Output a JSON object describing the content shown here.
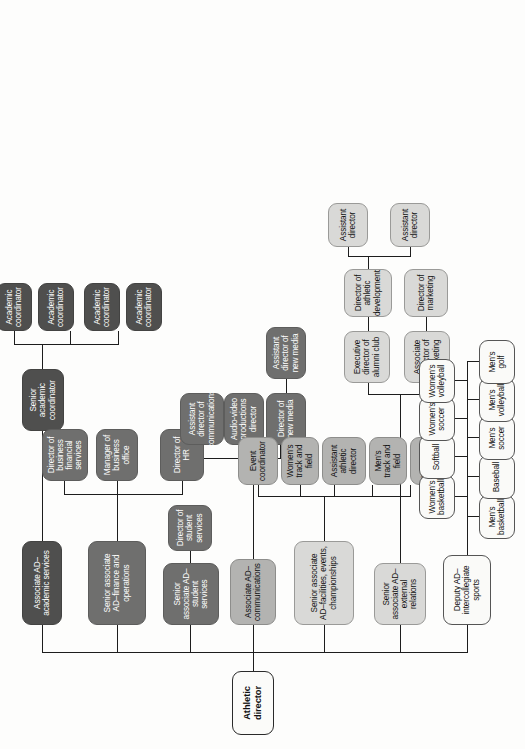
{
  "chart": {
    "type": "org-chart",
    "orientation": "rotated-90",
    "palette": {
      "root": "#fbfbf9",
      "white": "#fafaf8",
      "light": "#d9d9d7",
      "mid": "#b3b3b1",
      "dark": "#6f6f6e",
      "darker": "#4f4f4e",
      "line": "#1d1d1d"
    }
  },
  "root": {
    "label": "Athletic director"
  },
  "branches": {
    "academic_services": {
      "label": "Associate AD–academic services",
      "senior_coordinator": {
        "label": "Senior academic coordinator"
      },
      "coordinators": [
        {
          "label": "Academic coordinator"
        },
        {
          "label": "Academic coordinator"
        },
        {
          "label": "Academic coordinator"
        },
        {
          "label": "Academic coordinator"
        }
      ]
    },
    "finance_operations": {
      "label": "Senior associate AD–finance and operations",
      "children": [
        {
          "label": "Director of business financial services"
        },
        {
          "label": "Manager of business office"
        },
        {
          "label": "Director of HR"
        }
      ]
    },
    "student_services": {
      "label": "Senior associate AD–student services",
      "children": [
        {
          "label": "Director of student services"
        }
      ]
    },
    "communications": {
      "label": "Associate AD–communications",
      "children": [
        {
          "label": "Assistant director of communications"
        },
        {
          "label": "Audio-video productions director"
        },
        {
          "label": "Director of new media"
        }
      ],
      "new_media_child": {
        "label": "Assistant director of new media"
      }
    },
    "facilities": {
      "label": "Senior associate AD–facilities, events, championships",
      "children": [
        {
          "label": "Event coordinator"
        },
        {
          "label": "Women’s track and field"
        },
        {
          "label": "Assistant athletic director"
        },
        {
          "label": "Men’s track and field"
        },
        {
          "label": "Women’s tennis"
        }
      ]
    },
    "external_relations": {
      "label": "Senior associate AD–external relations",
      "children": [
        {
          "label": "Associate director of marketing"
        },
        {
          "label": "Executive director of alumni club"
        }
      ],
      "marketing_child": {
        "label": "Director of marketing"
      },
      "alumni_child": {
        "label": "Director of athletic development"
      },
      "development_children": [
        {
          "label": "Assistant director"
        },
        {
          "label": "Assistant director"
        }
      ]
    },
    "intercollegiate_sports": {
      "label": "Deputy AD–intercollegiate sports",
      "sports_top": [
        {
          "label": "Women’s basketball"
        },
        {
          "label": "Softball"
        },
        {
          "label": "Women’s soccer"
        },
        {
          "label": "Women’s volleyball"
        }
      ],
      "sports_bottom": [
        {
          "label": "Men’s basketball"
        },
        {
          "label": "Baseball"
        },
        {
          "label": "Men’s soccer"
        },
        {
          "label": "Men’s volleyball"
        },
        {
          "label": "Men’s golf"
        }
      ]
    }
  }
}
